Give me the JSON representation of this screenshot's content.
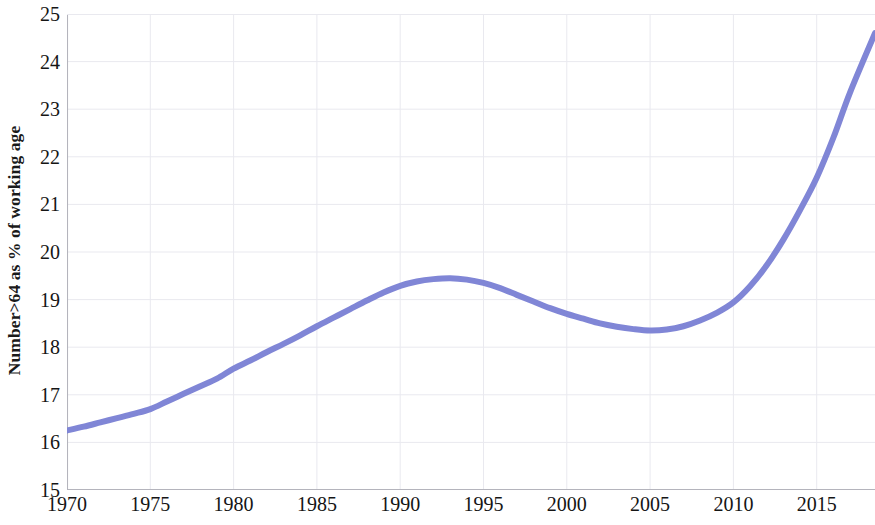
{
  "chart_data": {
    "type": "line",
    "title": "",
    "subtitle": "",
    "xlabel": "",
    "ylabel": "Number>64 as % of working age",
    "xlim": [
      1970,
      2018.5
    ],
    "ylim": [
      15,
      25
    ],
    "grid": true,
    "legend": null,
    "legend_position": "none",
    "x_ticks": [
      1970,
      1975,
      1980,
      1985,
      1990,
      1995,
      2000,
      2005,
      2010,
      2015
    ],
    "x_tick_labels": [
      "1970",
      "1975",
      "1980",
      "1985",
      "1990",
      "1995",
      "2000",
      "2005",
      "2010",
      "2015"
    ],
    "y_ticks": [
      15,
      16,
      17,
      18,
      19,
      20,
      21,
      22,
      23,
      24,
      25
    ],
    "y_tick_labels": [
      "15",
      "16",
      "17",
      "18",
      "19",
      "20",
      "21",
      "22",
      "23",
      "24",
      "25"
    ],
    "line_color": "#8086d6",
    "line_width": 6,
    "grid_color": "#e9e9ef",
    "background_color": "#ffffff",
    "series": [
      {
        "name": "Number>64 as % of working age",
        "color": "#8086d6",
        "x": [
          1970,
          1971,
          1972,
          1973,
          1974,
          1975,
          1976,
          1977,
          1978,
          1979,
          1980,
          1981,
          1982,
          1983,
          1984,
          1985,
          1986,
          1987,
          1988,
          1989,
          1990,
          1991,
          1992,
          1993,
          1994,
          1995,
          1996,
          1997,
          1998,
          1999,
          2000,
          2001,
          2002,
          2003,
          2004,
          2005,
          2006,
          2007,
          2008,
          2009,
          2010,
          2011,
          2012,
          2013,
          2014,
          2015,
          2016,
          2017,
          2018.5
        ],
        "values": [
          16.25,
          16.33,
          16.42,
          16.51,
          16.6,
          16.7,
          16.86,
          17.02,
          17.18,
          17.34,
          17.55,
          17.72,
          17.9,
          18.07,
          18.25,
          18.44,
          18.62,
          18.8,
          18.98,
          19.15,
          19.29,
          19.38,
          19.43,
          19.45,
          19.42,
          19.35,
          19.24,
          19.1,
          18.96,
          18.82,
          18.7,
          18.6,
          18.5,
          18.43,
          18.38,
          18.35,
          18.37,
          18.44,
          18.56,
          18.72,
          18.94,
          19.28,
          19.72,
          20.26,
          20.88,
          21.56,
          22.4,
          23.35,
          24.6
        ]
      }
    ]
  },
  "axes": {
    "y_title": "Number>64 as % of working age"
  }
}
